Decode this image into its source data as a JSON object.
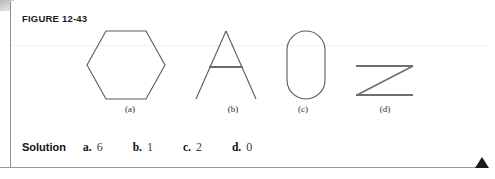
{
  "figure": {
    "label": "FIGURE 12-43",
    "box_border_color": "#8c8c8c"
  },
  "shapes": [
    {
      "id": "hexagon",
      "caption": "(a)",
      "icon": "hexagon-outline-icon",
      "stroke": "#5a5a5a",
      "stroke_width": 1.1,
      "viewbox": "0 0 82 74",
      "points": "21,3 61,3 80,37 61,71 21,71 2,37"
    },
    {
      "id": "letter-a",
      "caption": "(b)",
      "icon": "letter-a-outline-icon",
      "stroke": "#5a5a5a",
      "stroke_width": 1.1,
      "viewbox": "0 0 72 74",
      "left_leg": "36,3 6,71",
      "right_leg": "36,3 66,71",
      "crossbar": "19,39 53,39",
      "crossbar_width": 1.8
    },
    {
      "id": "stadium-oval",
      "caption": "(c)",
      "icon": "stadium-outline-icon",
      "stroke": "#5a5a5a",
      "stroke_width": 1.1,
      "viewbox": "0 0 44 74",
      "rect": {
        "x": 3,
        "y": 3,
        "width": 38,
        "height": 68,
        "rx": 19
      }
    },
    {
      "id": "letter-z",
      "caption": "(d)",
      "icon": "letter-z-outline-icon",
      "stroke": "#6a6a6a",
      "stroke_width": 1.8,
      "viewbox": "0 0 64 38",
      "top_bar": "3,4 60,4",
      "diagonal": "60,4 4,33",
      "bottom_bar": "3,33 60,33"
    }
  ],
  "solution": {
    "word": "Solution",
    "answers": [
      {
        "key": "a.",
        "value": "6"
      },
      {
        "key": "b.",
        "value": "1"
      },
      {
        "key": "c.",
        "value": "2"
      },
      {
        "key": "d.",
        "value": "0"
      }
    ]
  },
  "decor": {
    "corner_marker": "next-page-triangle-icon",
    "corner_marker_color": "#1c1c1c"
  }
}
